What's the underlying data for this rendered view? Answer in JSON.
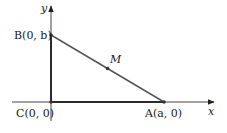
{
  "diagram": {
    "type": "coordinate-geometry",
    "colors": {
      "axis": "#333333",
      "triangle": "#2b2b2b",
      "hypotenuse": "#555555",
      "point": "#333333"
    },
    "axes": {
      "x_label": "x",
      "y_label": "y"
    },
    "points": {
      "A": {
        "label": "A(a, 0)",
        "name": "A",
        "coords": "(a, 0)"
      },
      "B": {
        "label": "B(0, b)",
        "name": "B",
        "coords": "(0, b)"
      },
      "C": {
        "label": "C(0, 0)",
        "name": "C",
        "coords": "(0, 0)"
      },
      "M": {
        "label": "M"
      }
    },
    "segments": [
      "CA",
      "CB",
      "AB"
    ]
  }
}
